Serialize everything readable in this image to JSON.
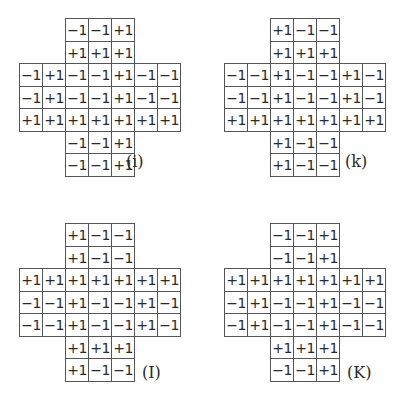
{
  "diagrams": [
    {
      "id": "i",
      "label": "(i)",
      "top": [
        [
          "−1",
          "−1",
          "+1"
        ],
        [
          "+1",
          "+1",
          "+1"
        ]
      ],
      "middle": [
        [
          "−1",
          "+1",
          "−1",
          "−1",
          "+1",
          "−1",
          "−1"
        ],
        [
          "−1",
          "+1",
          "−1",
          "−1",
          "+1",
          "−1",
          "−1"
        ],
        [
          "+1",
          "+1",
          "+1",
          "+1",
          "+1",
          "+1",
          "+1"
        ]
      ],
      "bottom": [
        [
          "−1",
          "−1",
          "+1"
        ],
        [
          "−1",
          "−1",
          "+1"
        ]
      ]
    },
    {
      "id": "k",
      "label": "(k)",
      "top": [
        [
          "+1",
          "−1",
          "−1"
        ],
        [
          "+1",
          "+1",
          "+1"
        ]
      ],
      "middle": [
        [
          "−1",
          "−1",
          "+1",
          "−1",
          "−1",
          "+1",
          "−1"
        ],
        [
          "−1",
          "−1",
          "+1",
          "−1",
          "−1",
          "+1",
          "−1"
        ],
        [
          "+1",
          "+1",
          "+1",
          "+1",
          "+1",
          "+1",
          "+1"
        ]
      ],
      "bottom": [
        [
          "+1",
          "−1",
          "−1"
        ],
        [
          "+1",
          "−1",
          "−1"
        ]
      ]
    },
    {
      "id": "I",
      "label": "(I)",
      "top": [
        [
          "+1",
          "−1",
          "−1"
        ],
        [
          "+1",
          "−1",
          "−1"
        ]
      ],
      "middle": [
        [
          "+1",
          "+1",
          "+1",
          "+1",
          "+1",
          "+1",
          "+1"
        ],
        [
          "−1",
          "−1",
          "+1",
          "−1",
          "−1",
          "+1",
          "−1"
        ],
        [
          "−1",
          "−1",
          "+1",
          "−1",
          "−1",
          "+1",
          "−1"
        ]
      ],
      "bottom": [
        [
          "+1",
          "+1",
          "+1"
        ],
        [
          "+1",
          "−1",
          "−1"
        ]
      ]
    },
    {
      "id": "K",
      "label": "(K)",
      "top": [
        [
          "−1",
          "−1",
          "+1"
        ],
        [
          "−1",
          "−1",
          "+1"
        ]
      ],
      "middle": [
        [
          "+1",
          "+1",
          "+1",
          "+1",
          "+1",
          "+1",
          "+1"
        ],
        [
          "−1",
          "+1",
          "−1",
          "−1",
          "+1",
          "−1",
          "−1"
        ],
        [
          "−1",
          "+1",
          "−1",
          "−1",
          "+1",
          "−1",
          "−1"
        ]
      ],
      "bottom": [
        [
          "+1",
          "+1",
          "+1"
        ],
        [
          "−1",
          "−1",
          "+1"
        ]
      ]
    }
  ]
}
